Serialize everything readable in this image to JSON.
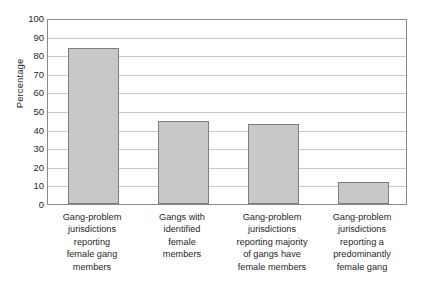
{
  "chart_data": {
    "type": "bar",
    "title": "",
    "xlabel": "",
    "ylabel": "Percentage",
    "ylim": [
      0,
      100
    ],
    "ytick_step": 10,
    "yticks": [
      "100",
      "90",
      "80",
      "70",
      "60",
      "50",
      "40",
      "30",
      "20",
      "10",
      "0"
    ],
    "grid": true,
    "legend": "none",
    "orientation": "vertical",
    "bar_color": "#c8c8c8",
    "bar_edge_color": "#7d7d7d",
    "grid_color": "#c9c9c9",
    "frame_color": "#8a8a8a",
    "background": "#ffffff",
    "categories": [
      "Gang-problem jurisdictions reporting female gang members",
      "Gangs with identified female members",
      "Gang-problem jurisdictions reporting majority of gangs have female members",
      "Gang-problem jurisdictions reporting a predominantly female gang"
    ],
    "category_lines": [
      [
        "Gang-problem",
        "jurisdictions",
        "reporting",
        "female gang",
        "members"
      ],
      [
        "Gangs with",
        "identified",
        "female",
        "members"
      ],
      [
        "Gang-problem",
        "jurisdictions",
        "reporting majority",
        "of gangs have",
        "female members"
      ],
      [
        "Gang-problem",
        "jurisdictions",
        "reporting a",
        "predominantly",
        "female gang"
      ]
    ],
    "values": [
      84,
      44.5,
      43,
      12
    ]
  }
}
